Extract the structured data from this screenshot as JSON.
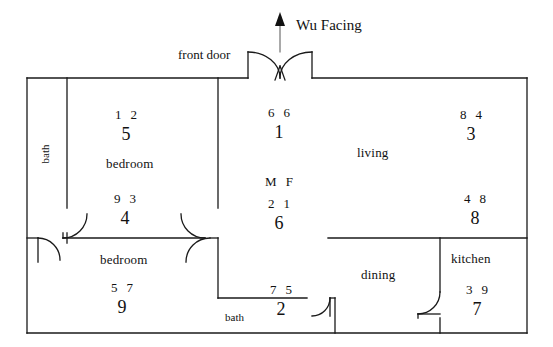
{
  "diagram": {
    "title": "Wu Facing",
    "front_door_label": "front door",
    "orientation_arrow": "north-arrow-up"
  },
  "rooms": [
    {
      "key": "bath_left",
      "label": "bath",
      "orientation": "vertical"
    },
    {
      "key": "bedroom_upper",
      "label": "bedroom",
      "orientation": "horizontal"
    },
    {
      "key": "bedroom_lower",
      "label": "bedroom",
      "orientation": "horizontal"
    },
    {
      "key": "living",
      "label": "living",
      "orientation": "horizontal"
    },
    {
      "key": "dining",
      "label": "dining",
      "orientation": "horizontal"
    },
    {
      "key": "kitchen",
      "label": "kitchen",
      "orientation": "horizontal"
    },
    {
      "key": "bath_lower",
      "label": "bath",
      "orientation": "horizontal"
    }
  ],
  "star_clusters": [
    {
      "key": "bedroom_upper_top",
      "mountain": "1",
      "water": "2",
      "period": "5"
    },
    {
      "key": "bedroom_upper_bot",
      "mountain": "9",
      "water": "3",
      "period": "4"
    },
    {
      "key": "entry_top",
      "mountain": "6",
      "water": "6",
      "period": "1"
    },
    {
      "key": "entry_bot",
      "mountain": "2",
      "water": "1",
      "period": "6"
    },
    {
      "key": "living_top",
      "mountain": "8",
      "water": "4",
      "period": "3"
    },
    {
      "key": "living_bot",
      "mountain": "4",
      "water": "8",
      "period": "8"
    },
    {
      "key": "bedroom_lower",
      "mountain": "5",
      "water": "7",
      "period": "9"
    },
    {
      "key": "bath_lower",
      "mountain": "7",
      "water": "5",
      "period": "2"
    },
    {
      "key": "kitchen",
      "mountain": "3",
      "water": "9",
      "period": "7"
    }
  ],
  "mf_marker": {
    "m": "M",
    "f": "F"
  },
  "colors": {
    "wall": "#1a1a1a",
    "text": "#111111",
    "background": "#ffffff"
  }
}
